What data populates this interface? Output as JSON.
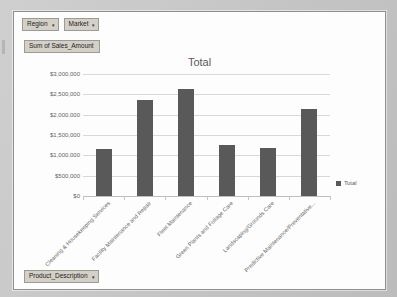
{
  "window": {
    "background_color": "#c6c6c6",
    "frame_color": "#fdfdfd"
  },
  "pivot": {
    "filter_buttons": [
      {
        "label": "Region",
        "caret": "▾"
      },
      {
        "label": "Market",
        "caret": "▾"
      }
    ],
    "value_field": {
      "label": "Sum of Sales_Amount"
    },
    "axis_field": {
      "label": "Product_Description",
      "caret": "▾"
    }
  },
  "chart_data": {
    "type": "bar",
    "title": "Total",
    "xlabel": "",
    "ylabel": "",
    "ylim": [
      0,
      3000000
    ],
    "ytick_labels": [
      "$3,000,000",
      "$2,500,000",
      "$2,000,000",
      "$1,500,000",
      "$1,000,000",
      "$500,000",
      "$0"
    ],
    "ytick_values": [
      3000000,
      2500000,
      2000000,
      1500000,
      1000000,
      500000,
      0
    ],
    "grid": true,
    "legend_position": "right",
    "legend": [
      "Total"
    ],
    "series_color": "#595959",
    "categories": [
      "Cleaning & Housekeeping Services",
      "Facility Maintenance and Repair",
      "Fleet Maintenance",
      "Green Plants and Foliage Care",
      "Landscaping/Grounds Care",
      "Predictive Maintenance/Preventative..."
    ],
    "series": [
      {
        "name": "Total",
        "values": [
          1150000,
          2370000,
          2630000,
          1260000,
          1180000,
          2150000
        ]
      }
    ]
  }
}
